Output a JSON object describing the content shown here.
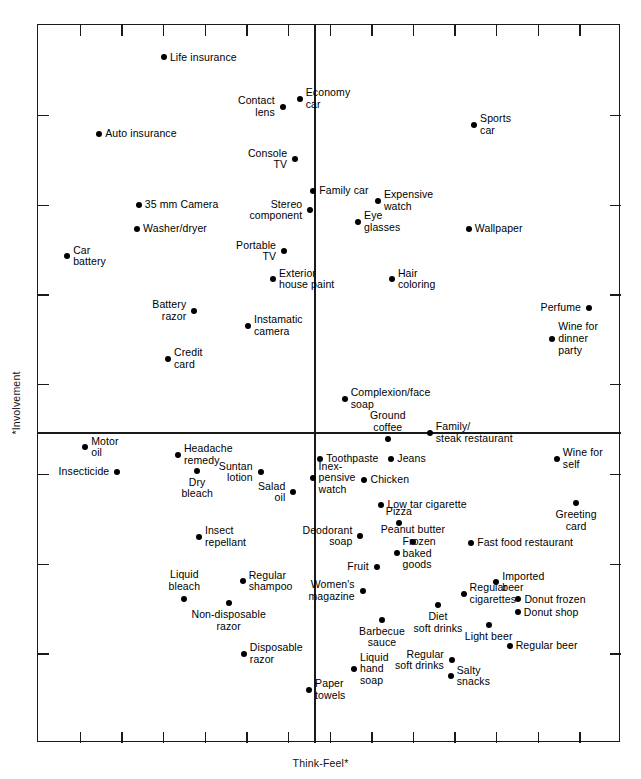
{
  "chart_data": {
    "type": "scatter",
    "title": "",
    "xlabel": "Think-Feel*",
    "ylabel": "*Involvement",
    "xlim": [
      0,
      100
    ],
    "ylim": [
      0,
      100
    ],
    "grid": false,
    "legend": null,
    "axis_origin": {
      "x": 47.3,
      "y": 43.3
    },
    "x_ticks": 14,
    "y_ticks": 8,
    "note": "FCB grid / Vaughn product positioning map. x = Think-Feel, y = Involvement. Values are percent of plot-frame width/height measured from lower-left of the frame.",
    "points": [
      {
        "label": "Life insurance",
        "x": 21.6,
        "y": 95.5,
        "side": "right"
      },
      {
        "label": "Contact\nlens",
        "x": 42.0,
        "y": 88.6,
        "side": "left"
      },
      {
        "label": "Economy\ncar",
        "x": 44.9,
        "y": 89.7,
        "side": "right"
      },
      {
        "label": "Sports\ncar",
        "x": 74.8,
        "y": 86.1,
        "side": "right"
      },
      {
        "label": "Auto insurance",
        "x": 10.5,
        "y": 84.8,
        "side": "right"
      },
      {
        "label": "Console\nTV",
        "x": 44.1,
        "y": 81.3,
        "side": "left"
      },
      {
        "label": "Family car",
        "x": 47.2,
        "y": 76.9,
        "side": "right"
      },
      {
        "label": "Stereo\ncomponent",
        "x": 46.7,
        "y": 74.2,
        "side": "left"
      },
      {
        "label": "Expensive\nwatch",
        "x": 58.3,
        "y": 75.5,
        "side": "right"
      },
      {
        "label": "35 mm Camera",
        "x": 17.3,
        "y": 74.9,
        "side": "right"
      },
      {
        "label": "Eye\nglasses",
        "x": 54.9,
        "y": 72.6,
        "side": "right"
      },
      {
        "label": "Wallpaper",
        "x": 73.9,
        "y": 71.6,
        "side": "right"
      },
      {
        "label": "Washer/dryer",
        "x": 17.0,
        "y": 71.6,
        "side": "right"
      },
      {
        "label": "Portable\nTV",
        "x": 42.2,
        "y": 68.5,
        "side": "left"
      },
      {
        "label": "Car\nbattery",
        "x": 5.0,
        "y": 67.8,
        "side": "right"
      },
      {
        "label": "Exterior\nhouse paint",
        "x": 40.3,
        "y": 64.6,
        "side": "right"
      },
      {
        "label": "Hair\ncoloring",
        "x": 60.7,
        "y": 64.6,
        "side": "right"
      },
      {
        "label": "Battery\nrazor",
        "x": 26.8,
        "y": 60.2,
        "side": "left"
      },
      {
        "label": "Instamatic\ncamera",
        "x": 36.0,
        "y": 58.1,
        "side": "right"
      },
      {
        "label": "Perfume",
        "x": 94.5,
        "y": 60.6,
        "side": "left"
      },
      {
        "label": "Wine for\ndinner\nparty",
        "x": 88.2,
        "y": 56.3,
        "side": "right"
      },
      {
        "label": "Credit\ncard",
        "x": 22.3,
        "y": 53.5,
        "side": "right"
      },
      {
        "label": "Complexion/face\nsoap",
        "x": 52.6,
        "y": 47.9,
        "side": "right"
      },
      {
        "label": "Ground\ncoffee",
        "x": 60.0,
        "y": 42.3,
        "side": "above"
      },
      {
        "label": "Family/\nsteak restaurant",
        "x": 67.2,
        "y": 43.2,
        "side": "right"
      },
      {
        "label": "Motor\noil",
        "x": 8.1,
        "y": 41.2,
        "side": "right"
      },
      {
        "label": "Headache\nremedy",
        "x": 24.0,
        "y": 40.1,
        "side": "right"
      },
      {
        "label": "Toothpaste",
        "x": 48.4,
        "y": 39.6,
        "side": "right"
      },
      {
        "label": "Jeans",
        "x": 60.6,
        "y": 39.6,
        "side": "right"
      },
      {
        "label": "Wine for\nself",
        "x": 89.0,
        "y": 39.6,
        "side": "right"
      },
      {
        "label": "Insecticide",
        "x": 13.6,
        "y": 37.8,
        "side": "left"
      },
      {
        "label": "Dry\nbleach",
        "x": 27.3,
        "y": 37.9,
        "side": "below"
      },
      {
        "label": "Suntan\nlotion",
        "x": 38.2,
        "y": 37.7,
        "side": "left"
      },
      {
        "label": "Inex-\npensive\nwatch",
        "x": 47.1,
        "y": 36.9,
        "side": "right"
      },
      {
        "label": "Chicken",
        "x": 56.0,
        "y": 36.6,
        "side": "right"
      },
      {
        "label": "Salad\noil",
        "x": 43.8,
        "y": 34.9,
        "side": "left"
      },
      {
        "label": "Greeting\ncard",
        "x": 92.3,
        "y": 33.4,
        "side": "below"
      },
      {
        "label": "Low tar cigarette",
        "x": 58.9,
        "y": 33.2,
        "side": "right"
      },
      {
        "label": "Pizza",
        "x": 61.9,
        "y": 30.6,
        "side": "above"
      },
      {
        "label": "Deodorant\nsoap",
        "x": 55.3,
        "y": 28.8,
        "side": "left"
      },
      {
        "label": "Peanut butter",
        "x": 64.3,
        "y": 28.0,
        "side": "above"
      },
      {
        "label": "Insect\nrepellant",
        "x": 27.6,
        "y": 28.7,
        "side": "right"
      },
      {
        "label": "Fast food restaurant",
        "x": 74.3,
        "y": 27.9,
        "side": "right"
      },
      {
        "label": "Frozen\nbaked\ngoods",
        "x": 61.5,
        "y": 26.4,
        "side": "right"
      },
      {
        "label": "Fruit",
        "x": 58.1,
        "y": 24.5,
        "side": "left"
      },
      {
        "label": "Imported\nbeer",
        "x": 78.6,
        "y": 22.4,
        "side": "right"
      },
      {
        "label": "Regular\nshampoo",
        "x": 35.1,
        "y": 22.5,
        "side": "right"
      },
      {
        "label": "Women's\nmagazine",
        "x": 55.7,
        "y": 21.2,
        "side": "left"
      },
      {
        "label": "Regular\ncigarettes",
        "x": 73.0,
        "y": 20.8,
        "side": "right"
      },
      {
        "label": "Liquid\nbleach",
        "x": 25.1,
        "y": 20.1,
        "side": "above"
      },
      {
        "label": "Donut frozen",
        "x": 82.4,
        "y": 20.0,
        "side": "right"
      },
      {
        "label": "Non-disposable\nrazor",
        "x": 32.7,
        "y": 19.5,
        "side": "below"
      },
      {
        "label": "Diet\nsoft drinks",
        "x": 68.6,
        "y": 19.2,
        "side": "below"
      },
      {
        "label": "Donut shop",
        "x": 82.3,
        "y": 18.2,
        "side": "right"
      },
      {
        "label": "Barbecue\nsauce",
        "x": 59.0,
        "y": 17.2,
        "side": "below"
      },
      {
        "label": "Light beer",
        "x": 77.3,
        "y": 16.4,
        "side": "below"
      },
      {
        "label": "Regular beer",
        "x": 80.9,
        "y": 13.5,
        "side": "right"
      },
      {
        "label": "Disposable\nrazor",
        "x": 35.3,
        "y": 12.4,
        "side": "right"
      },
      {
        "label": "Regular\nsoft drinks",
        "x": 71.0,
        "y": 11.5,
        "side": "left"
      },
      {
        "label": "Liquid\nhand\nsoap",
        "x": 54.2,
        "y": 10.3,
        "side": "right"
      },
      {
        "label": "Salty\nsnacks",
        "x": 70.8,
        "y": 9.3,
        "side": "right"
      },
      {
        "label": "Paper\ntowels",
        "x": 46.5,
        "y": 7.4,
        "side": "right"
      }
    ]
  },
  "colors": {
    "axis": "#1a1a1a",
    "point": "#000000",
    "text": "#000000",
    "background": "#ffffff"
  }
}
